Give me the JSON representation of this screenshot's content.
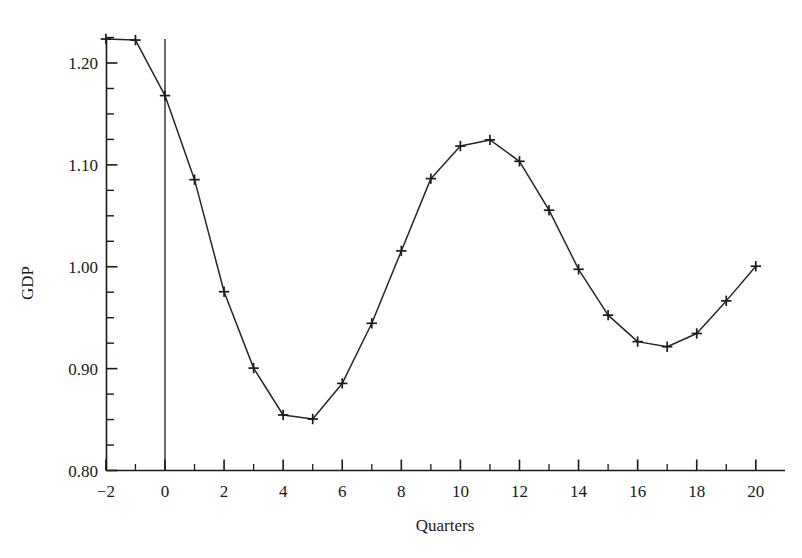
{
  "chart_data": {
    "type": "line",
    "title": "",
    "subtitle": "",
    "xlabel": "Quarters",
    "ylabel": "GDP",
    "xlim": [
      -2,
      20
    ],
    "ylim": [
      0.8,
      1.225
    ],
    "grid": false,
    "legend": null,
    "marker": "plus",
    "line_color": "#262626",
    "marker_color": "#1a1a1a",
    "background_color": "#ffffff",
    "xticks": [
      -2,
      0,
      2,
      4,
      6,
      8,
      10,
      12,
      14,
      16,
      18,
      20
    ],
    "xtick_labels": [
      "−2",
      "0",
      "2",
      "4",
      "6",
      "8",
      "10",
      "12",
      "14",
      "16",
      "18",
      "20"
    ],
    "xminor_ticks": [
      -1,
      1,
      3,
      5,
      7,
      9,
      11,
      13,
      15,
      17,
      19
    ],
    "yticks": [
      0.8,
      0.9,
      1.0,
      1.1,
      1.2
    ],
    "ytick_labels": [
      "0.80",
      "0.90",
      "1.00",
      "1.10",
      "1.20"
    ],
    "yminor_ticks": [
      0.825,
      0.85,
      0.875,
      0.925,
      0.95,
      0.975,
      1.025,
      1.05,
      1.075,
      1.125,
      1.15,
      1.175,
      1.225
    ],
    "annotations": [
      {
        "type": "vline",
        "name": "shock-reference-line",
        "x": 0,
        "y_from": 0.8,
        "y_to": 1.2235
      }
    ],
    "x": [
      -2,
      -1,
      0,
      1,
      2,
      3,
      4,
      5,
      6,
      7,
      8,
      9,
      10,
      11,
      12,
      13,
      14,
      15,
      16,
      17,
      18,
      19,
      20
    ],
    "values": [
      1.2235,
      1.2225,
      1.168,
      1.0855,
      0.9755,
      0.9005,
      0.8545,
      0.8505,
      0.8855,
      0.9445,
      1.0155,
      1.0865,
      1.1185,
      1.1245,
      1.1035,
      1.0555,
      0.9975,
      0.9525,
      0.9265,
      0.9215,
      0.9345,
      0.9665,
      1.0005
    ],
    "series": [
      {
        "name": "GDP",
        "values": [
          1.2235,
          1.2225,
          1.168,
          1.0855,
          0.9755,
          0.9005,
          0.8545,
          0.8505,
          0.8855,
          0.9445,
          1.0155,
          1.0865,
          1.1185,
          1.1245,
          1.1035,
          1.0555,
          0.9975,
          0.9525,
          0.9265,
          0.9215,
          0.9345,
          0.9665,
          1.0005
        ]
      }
    ]
  }
}
